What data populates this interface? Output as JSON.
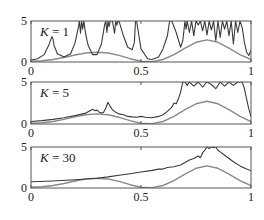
{
  "chart_data": [
    {
      "type": "line",
      "panel_label": "K = 1",
      "k_var": "K",
      "k_value": "1",
      "xlim": [
        0,
        1
      ],
      "ylim": [
        0,
        5
      ],
      "xticks": [
        "0",
        "0.5",
        "1"
      ],
      "yticks": [
        "0",
        "5"
      ],
      "grid": false,
      "series": [
        {
          "name": "estimate",
          "color": "#3a3a3a",
          "x": [
            0,
            0.03,
            0.06,
            0.08,
            0.095,
            0.1,
            0.105,
            0.12,
            0.15,
            0.18,
            0.2,
            0.215,
            0.22,
            0.225,
            0.23,
            0.235,
            0.24,
            0.25,
            0.26,
            0.28,
            0.3,
            0.32,
            0.335,
            0.34,
            0.345,
            0.35,
            0.355,
            0.36,
            0.37,
            0.38,
            0.385,
            0.39,
            0.395,
            0.4,
            0.42,
            0.44,
            0.46,
            0.47,
            0.475,
            0.48,
            0.5,
            0.53,
            0.55,
            0.58,
            0.6,
            0.62,
            0.63,
            0.635,
            0.64,
            0.66,
            0.68,
            0.69,
            0.7,
            0.705,
            0.71,
            0.72,
            0.73,
            0.74,
            0.75,
            0.76,
            0.77,
            0.78,
            0.79,
            0.8,
            0.81,
            0.82,
            0.83,
            0.84,
            0.85,
            0.86,
            0.87,
            0.88,
            0.89,
            0.9,
            0.91,
            0.92,
            0.93,
            0.94,
            0.95,
            0.96,
            0.97,
            0.98,
            0.99,
            1.0
          ],
          "y": [
            0.25,
            0.4,
            0.9,
            2.0,
            3.1,
            2.8,
            2.0,
            1.0,
            0.6,
            1.0,
            2.3,
            4.2,
            5,
            3.5,
            5,
            4.0,
            5,
            3.2,
            2.0,
            0.9,
            0.9,
            2.2,
            4.6,
            5,
            3.6,
            5,
            4.3,
            5,
            5,
            3.5,
            5,
            4.5,
            5,
            5,
            3.2,
            1.8,
            1.5,
            2.4,
            5,
            5,
            1.6,
            0.4,
            0.3,
            0.6,
            1.6,
            3.2,
            5,
            5,
            5,
            3.6,
            1.8,
            2.6,
            5,
            4.0,
            5,
            3.6,
            5,
            3.2,
            5,
            4.5,
            5,
            3.8,
            5,
            3.3,
            5,
            3.9,
            5,
            2.6,
            5,
            3.0,
            5,
            4.0,
            5,
            3.2,
            5,
            2.2,
            5,
            3.6,
            5,
            4.2,
            2.4,
            1.2,
            0.8,
            1.4
          ]
        },
        {
          "name": "true function",
          "color": "#8a8a8a",
          "x": [
            0,
            0.05,
            0.1,
            0.15,
            0.2,
            0.25,
            0.3,
            0.35,
            0.4,
            0.45,
            0.5,
            0.55,
            0.6,
            0.65,
            0.7,
            0.75,
            0.8,
            0.85,
            0.9,
            0.95,
            1.0
          ],
          "y": [
            0.1,
            0.15,
            0.3,
            0.55,
            0.85,
            1.1,
            1.2,
            1.1,
            0.8,
            0.4,
            0.1,
            0.05,
            0.3,
            0.9,
            1.7,
            2.4,
            2.7,
            2.4,
            1.7,
            0.9,
            0.3
          ]
        }
      ]
    },
    {
      "type": "line",
      "panel_label": "K = 5",
      "k_var": "K",
      "k_value": "5",
      "xlim": [
        0,
        1
      ],
      "ylim": [
        0,
        5
      ],
      "xticks": [
        "0",
        "0.5",
        "1"
      ],
      "yticks": [
        "0",
        "5"
      ],
      "grid": false,
      "series": [
        {
          "name": "estimate",
          "color": "#3a3a3a",
          "x": [
            0,
            0.05,
            0.1,
            0.15,
            0.2,
            0.25,
            0.27,
            0.28,
            0.29,
            0.3,
            0.31,
            0.32,
            0.33,
            0.34,
            0.35,
            0.36,
            0.37,
            0.38,
            0.4,
            0.42,
            0.44,
            0.46,
            0.48,
            0.5,
            0.52,
            0.55,
            0.58,
            0.6,
            0.62,
            0.64,
            0.65,
            0.66,
            0.67,
            0.68,
            0.69,
            0.7,
            0.71,
            0.72,
            0.74,
            0.76,
            0.78,
            0.8,
            0.82,
            0.84,
            0.86,
            0.88,
            0.9,
            0.92,
            0.94,
            0.96,
            0.97,
            0.98,
            0.99,
            1.0
          ],
          "y": [
            0.3,
            0.4,
            0.55,
            0.75,
            1.0,
            1.3,
            1.6,
            1.75,
            1.6,
            1.65,
            1.4,
            1.3,
            1.4,
            1.9,
            2.6,
            2.1,
            1.7,
            1.5,
            1.2,
            1.1,
            0.9,
            0.85,
            0.8,
            0.9,
            0.8,
            0.75,
            0.9,
            1.1,
            1.5,
            2.0,
            2.5,
            2.4,
            3.0,
            3.8,
            5,
            5,
            4.6,
            5,
            4.5,
            5,
            4.4,
            5,
            4.7,
            4.2,
            5,
            4.5,
            5,
            4.6,
            5,
            5,
            4.2,
            3.0,
            1.8,
            0.9
          ]
        },
        {
          "name": "true function",
          "color": "#8a8a8a",
          "x": [
            0,
            0.05,
            0.1,
            0.15,
            0.2,
            0.25,
            0.3,
            0.35,
            0.4,
            0.45,
            0.5,
            0.55,
            0.6,
            0.65,
            0.7,
            0.75,
            0.8,
            0.85,
            0.9,
            0.95,
            1.0
          ],
          "y": [
            0.1,
            0.15,
            0.3,
            0.55,
            0.85,
            1.1,
            1.2,
            1.1,
            0.8,
            0.4,
            0.1,
            0.05,
            0.3,
            0.9,
            1.7,
            2.4,
            2.7,
            2.4,
            1.7,
            0.9,
            0.3
          ]
        }
      ]
    },
    {
      "type": "line",
      "panel_label": "K = 30",
      "k_var": "K",
      "k_value": "30",
      "xlim": [
        0,
        1
      ],
      "ylim": [
        0,
        5
      ],
      "xticks": [
        "0",
        "0.5",
        "1"
      ],
      "yticks": [
        "0",
        "5"
      ],
      "grid": false,
      "series": [
        {
          "name": "estimate",
          "color": "#3a3a3a",
          "x": [
            0,
            0.1,
            0.2,
            0.3,
            0.35,
            0.4,
            0.45,
            0.5,
            0.55,
            0.58,
            0.6,
            0.62,
            0.65,
            0.68,
            0.7,
            0.72,
            0.74,
            0.76,
            0.77,
            0.78,
            0.79,
            0.8,
            0.81,
            0.82,
            0.83,
            0.84,
            0.85,
            0.86,
            0.88,
            0.9,
            0.92,
            0.95,
            0.98,
            1.0
          ],
          "y": [
            0.75,
            0.85,
            1.0,
            1.2,
            1.35,
            1.55,
            1.75,
            1.95,
            2.15,
            2.3,
            2.3,
            2.5,
            2.6,
            2.8,
            3.1,
            3.4,
            3.6,
            3.9,
            3.7,
            4.3,
            4.6,
            5,
            4.8,
            5,
            4.9,
            5,
            4.6,
            4.4,
            4.0,
            3.6,
            3.2,
            2.7,
            2.3,
            2.1
          ]
        },
        {
          "name": "true function",
          "color": "#8a8a8a",
          "x": [
            0,
            0.05,
            0.1,
            0.15,
            0.2,
            0.25,
            0.3,
            0.35,
            0.4,
            0.45,
            0.5,
            0.55,
            0.6,
            0.65,
            0.7,
            0.75,
            0.8,
            0.85,
            0.9,
            0.95,
            1.0
          ],
          "y": [
            0.1,
            0.15,
            0.3,
            0.55,
            0.85,
            1.1,
            1.2,
            1.1,
            0.8,
            0.4,
            0.1,
            0.05,
            0.3,
            0.9,
            1.7,
            2.4,
            2.7,
            2.4,
            1.7,
            0.9,
            0.3
          ]
        }
      ]
    }
  ],
  "panels_layout": [
    {
      "left": 31,
      "right": 251,
      "top": 21,
      "bottom": 62
    },
    {
      "left": 31,
      "right": 251,
      "top": 82,
      "bottom": 124
    },
    {
      "left": 31,
      "right": 251,
      "top": 147,
      "bottom": 188
    }
  ],
  "colors": {
    "axes": "#555555",
    "estimate": "#3a3a3a",
    "truth": "#8a8a8a"
  }
}
